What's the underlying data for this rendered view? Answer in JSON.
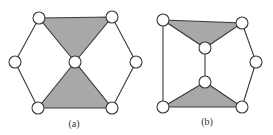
{
  "figure": {
    "colors": {
      "edge": "#3a3a3a",
      "shaded_face": "#a8a8a8",
      "node_fill": "#ffffff",
      "background": "#ffffff"
    },
    "node_radius": 6,
    "subfigures": [
      {
        "id": "a",
        "label": "(a)",
        "label_pos": [
          74,
          127
        ],
        "nodes": [
          {
            "id": "a1",
            "x": 39,
            "y": 18
          },
          {
            "id": "a2",
            "x": 112,
            "y": 17
          },
          {
            "id": "a3",
            "x": 15,
            "y": 62
          },
          {
            "id": "a4",
            "x": 75,
            "y": 62
          },
          {
            "id": "a5",
            "x": 136,
            "y": 62
          },
          {
            "id": "a6",
            "x": 38,
            "y": 108
          },
          {
            "id": "a7",
            "x": 112,
            "y": 108
          }
        ],
        "edges": [
          [
            "a1",
            "a3"
          ],
          [
            "a3",
            "a6"
          ],
          [
            "a2",
            "a5"
          ],
          [
            "a5",
            "a7"
          ]
        ],
        "shaded_triangles": [
          [
            "a1",
            "a2",
            "a4"
          ],
          [
            "a4",
            "a6",
            "a7"
          ]
        ]
      },
      {
        "id": "b",
        "label": "(b)",
        "label_pos": [
          207,
          125
        ],
        "nodes": [
          {
            "id": "b1",
            "x": 163,
            "y": 20
          },
          {
            "id": "b2",
            "x": 242,
            "y": 23
          },
          {
            "id": "b3",
            "x": 205,
            "y": 48
          },
          {
            "id": "b4",
            "x": 256,
            "y": 62
          },
          {
            "id": "b5",
            "x": 205,
            "y": 82
          },
          {
            "id": "b6",
            "x": 163,
            "y": 107
          },
          {
            "id": "b7",
            "x": 242,
            "y": 107
          }
        ],
        "edges": [
          [
            "b1",
            "b6"
          ],
          [
            "b3",
            "b5"
          ],
          [
            "b2",
            "b4"
          ],
          [
            "b4",
            "b7"
          ]
        ],
        "shaded_triangles": [
          [
            "b1",
            "b2",
            "b3"
          ],
          [
            "b5",
            "b6",
            "b7"
          ]
        ]
      }
    ]
  }
}
